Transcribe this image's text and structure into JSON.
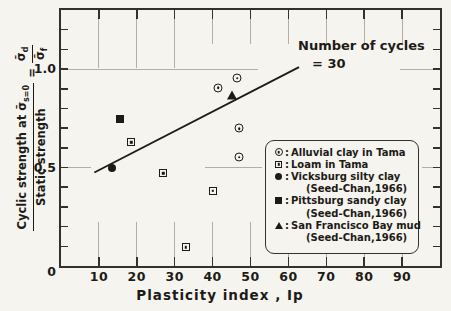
{
  "colors": {
    "ink": "#1d1b17",
    "faint": "#b2aea2",
    "frame": "#33312c",
    "background": "#f6f4ee"
  },
  "chart_data": {
    "type": "scatter",
    "title": "",
    "xlabel": "Plasticity  index , Ip",
    "ylabel_plain": "Cyclic strength at σ̄s=0 / Static strength = σ̄d/σ̄f",
    "xlim": [
      0,
      100
    ],
    "ylim": [
      0,
      1.3
    ],
    "grid": "partial dash-dot at major ticks",
    "legend_position": "lower right",
    "x_ticks": [
      10,
      20,
      30,
      40,
      50,
      60,
      70,
      80,
      90
    ],
    "y_ticks": [
      {
        "value": 1.0,
        "label": "1.0"
      },
      {
        "value": 0.5,
        "label": "0.5"
      },
      {
        "value": 0,
        "label": "0"
      }
    ],
    "y_minor_tick_step": 0.1,
    "grid_y": [
      1.0,
      0.5
    ],
    "annotation": {
      "line1": "Number of cycles",
      "line2": "= 30"
    },
    "y_axis_title": {
      "numerator_text": "Cyclic strength at ",
      "numerator_sigma": "σ̄",
      "numerator_sub": "s=0",
      "denominator": "Static  strength",
      "equals": "=",
      "ratio_top_sigma": "σ̄",
      "ratio_top_sub": "d",
      "ratio_bottom_sigma": "σ̄",
      "ratio_bottom_sub": "f"
    },
    "legend_colon": ":",
    "series": [
      {
        "name": "Alluvial clay in Tama",
        "source": "",
        "marker": "circle-dot",
        "points": [
          [
            41.5,
            0.905
          ],
          [
            46.5,
            1.0
          ],
          [
            47,
            0.79
          ],
          [
            47,
            0.69
          ]
        ]
      },
      {
        "name": "Loam in Tama",
        "source": "",
        "marker": "square-dot",
        "points": [
          [
            18.5,
            0.81
          ],
          [
            27,
            0.695
          ],
          [
            40,
            0.645
          ],
          [
            33,
            0.4
          ]
        ]
      },
      {
        "name": "Vicksburg silty clay",
        "source": "(Seed-Chan,1966)",
        "marker": "filled-circle",
        "points": [
          [
            13.5,
            0.5
          ]
        ]
      },
      {
        "name": "Pittsburg sandy clay",
        "source": "(Seed-Chan,1966)",
        "marker": "filled-square",
        "points": [
          [
            15.5,
            0.745
          ]
        ]
      },
      {
        "name": "San Francisco Bay mud",
        "source": "(Seed-Chan,1966)",
        "marker": "filled-triangle",
        "points": [
          [
            45,
            0.87
          ]
        ]
      }
    ],
    "trend_line": {
      "x1": 8.8,
      "y1": 0.475,
      "x2": 62.8,
      "y2": 1.01
    }
  }
}
